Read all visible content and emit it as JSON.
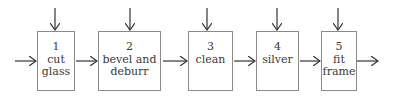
{
  "diagram": {
    "type": "process-flow",
    "steps": [
      {
        "number": "1",
        "label": "cut\nglass"
      },
      {
        "number": "2",
        "label": "bevel and\ndeburr"
      },
      {
        "number": "3",
        "label": "clean"
      },
      {
        "number": "4",
        "label": "silver"
      },
      {
        "number": "5",
        "label": "fit\nframe"
      }
    ],
    "colors": {
      "line": "#333333",
      "box_border": "#8a8a8a",
      "text": "#3a3a3a"
    }
  }
}
